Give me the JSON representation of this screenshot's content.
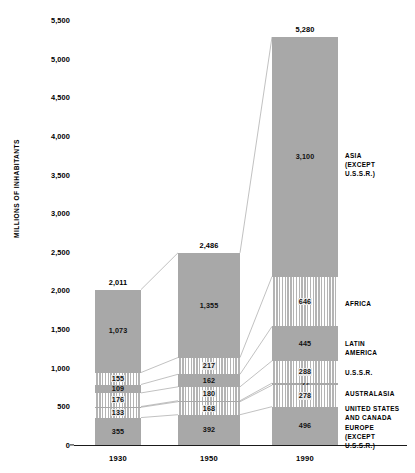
{
  "chart_data": {
    "type": "bar",
    "subtype": "stacked-bar",
    "title": "",
    "xlabel": "",
    "ylabel": "MILLIONS OF INHABITANTS",
    "ylim": [
      0,
      5500
    ],
    "ytick_step": 500,
    "grid": false,
    "legend_position": "right-outside",
    "categories": [
      "1930",
      "1950",
      "1990"
    ],
    "ytick_labels": [
      "5,500",
      "5,000",
      "4,500",
      "4,000",
      "3,500",
      "3,000",
      "2,500",
      "2,000",
      "1,500",
      "1,000",
      "500",
      "0"
    ],
    "ytick_values": [
      5500,
      5000,
      4500,
      4000,
      3500,
      3000,
      2500,
      2000,
      1500,
      1000,
      500,
      0
    ],
    "totals": [
      2011,
      2486,
      5280
    ],
    "total_labels": [
      "2,011",
      "2,486",
      "5,280"
    ],
    "series": [
      {
        "name": "ASIA (EXCEPT U.S.S.R.)",
        "legend_label": "ASIA\n(EXCEPT\nU.S.S.R.)",
        "fill": "solid",
        "values": [
          1073,
          1355,
          3100
        ],
        "labels": [
          "1,073",
          "1,355",
          "3,100"
        ]
      },
      {
        "name": "AFRICA",
        "legend_label": "AFRICA",
        "fill": "striped",
        "values": [
          155,
          217,
          646
        ],
        "labels": [
          "155",
          "217",
          "646"
        ]
      },
      {
        "name": "LATIN AMERICA",
        "legend_label": "LATIN\nAMERICA",
        "fill": "solid",
        "values": [
          109,
          162,
          445
        ],
        "labels": [
          "109",
          "162",
          "445"
        ]
      },
      {
        "name": "U.S.S.R.",
        "legend_label": "U.S.S.R.",
        "fill": "striped",
        "values": [
          176,
          180,
          288
        ],
        "labels": [
          "176",
          "180",
          "288"
        ]
      },
      {
        "name": "AUSTRALASIA",
        "legend_label": "AUSTRALASIA",
        "fill": "solid",
        "values": [
          10,
          13,
          27
        ],
        "labels": [
          "",
          "",
          "27"
        ]
      },
      {
        "name": "UNITED STATES AND CANADA",
        "legend_label": "UNITED STATES\nAND CANADA",
        "fill": "striped",
        "values": [
          133,
          168,
          278
        ],
        "labels": [
          "133",
          "168",
          "278"
        ]
      },
      {
        "name": "EUROPE (EXCEPT U.S.S.R.)",
        "legend_label": "EUROPE\n(EXCEPT\nU.S.S.R.)",
        "fill": "solid",
        "values": [
          355,
          392,
          496
        ],
        "labels": [
          "355",
          "392",
          "496"
        ]
      }
    ]
  },
  "colors": {
    "solid_fill": "#a8a8a8",
    "stripe_fill": "#c9c9c9",
    "axis": "#1a1a1a",
    "connector": "#8d8d8d",
    "text": "#000000",
    "background": "#ffffff"
  }
}
